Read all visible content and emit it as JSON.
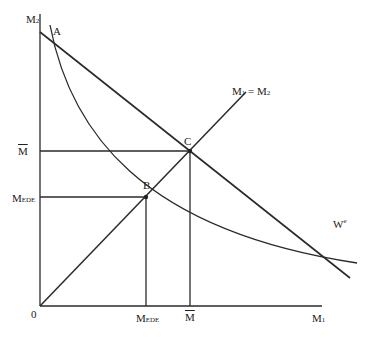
{
  "diagram": {
    "axes": {
      "y_label": "M",
      "y_sub": "2",
      "x_label": "M",
      "x_sub": "1",
      "origin": "0"
    },
    "points": {
      "A": "A",
      "B": "B",
      "C": "C"
    },
    "lines": {
      "diag_label_left": "M",
      "diag_sub_left": "1",
      "diag_eq": " = M",
      "diag_sub_right": "2",
      "curve_label": "W",
      "curve_sup": "e"
    },
    "ticks": {
      "mbar": "M",
      "mede": "M",
      "mede_sub": "EDE"
    }
  }
}
